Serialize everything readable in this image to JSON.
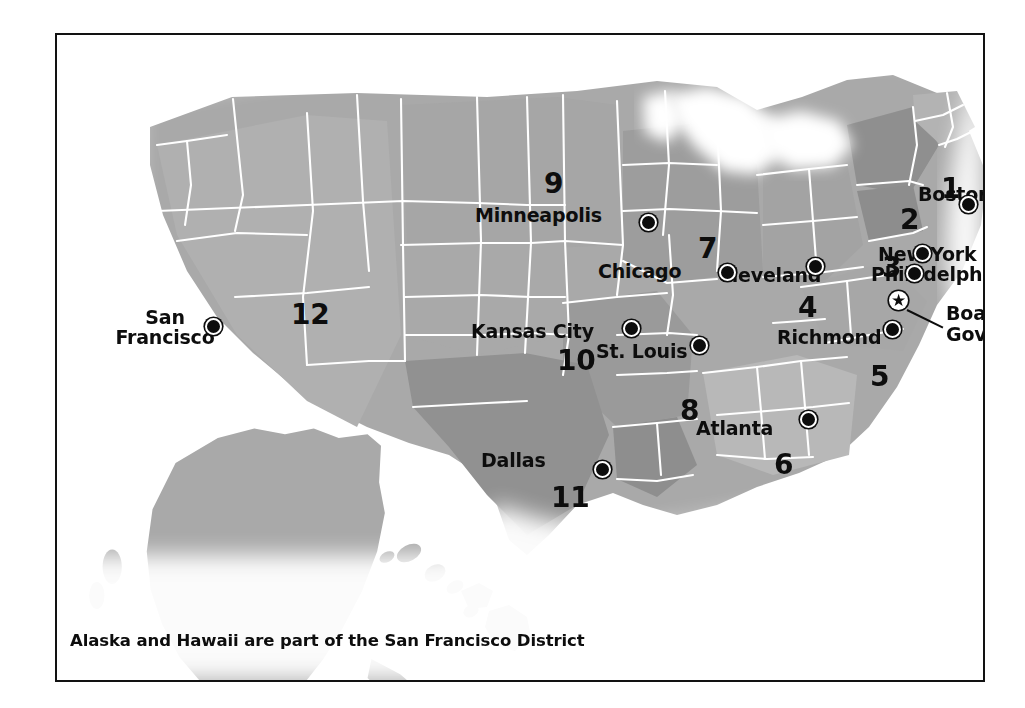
{
  "figure": {
    "footnote": "Alaska and Hawaii are part of the San Francisco District",
    "frame_color": "#121212",
    "background_color": "#ffffff",
    "land_color": "#a9a9a9",
    "border_color": "#ffffff",
    "marker_color": "#0d0d0d"
  },
  "districts": [
    {
      "number": "1",
      "bank": "Boston",
      "x": 891,
      "y": 153
    },
    {
      "number": "2",
      "bank": "New York",
      "x": 850,
      "y": 184
    },
    {
      "number": "3",
      "bank": "Philadelphia",
      "x": 832,
      "y": 232
    },
    {
      "number": "4",
      "bank": "Cleveland",
      "x": 748,
      "y": 272
    },
    {
      "number": "5",
      "bank": "Richmond",
      "x": 820,
      "y": 341
    },
    {
      "number": "6",
      "bank": "Atlanta",
      "x": 724,
      "y": 429
    },
    {
      "number": "7",
      "bank": "Chicago",
      "x": 648,
      "y": 213
    },
    {
      "number": "8",
      "bank": "St. Louis",
      "x": 630,
      "y": 375
    },
    {
      "number": "9",
      "bank": "Minneapolis",
      "x": 494,
      "y": 148
    },
    {
      "number": "10",
      "bank": "Kansas City",
      "x": 514,
      "y": 325
    },
    {
      "number": "11",
      "bank": "Dallas",
      "x": 508,
      "y": 462
    },
    {
      "number": "12",
      "bank": "San Francisco",
      "x": 248,
      "y": 279
    }
  ],
  "cities": [
    {
      "name": "Boston",
      "label_x": 916,
      "label_y": 159,
      "dot_x": 911,
      "dot_y": 169,
      "align": "left"
    },
    {
      "name": "New York",
      "label_x": 876,
      "label_y": 219,
      "dot_x": 865,
      "dot_y": 218,
      "align": "left"
    },
    {
      "name": "Philadelphia",
      "label_x": 869,
      "label_y": 239,
      "dot_x": 857,
      "dot_y": 238,
      "align": "left"
    },
    {
      "name": "Cleveland",
      "label_x": 716,
      "label_y": 240,
      "dot_x": 758,
      "dot_y": 231,
      "align": "left"
    },
    {
      "name": "Richmond",
      "label_x": 775,
      "label_y": 302,
      "dot_x": 835,
      "dot_y": 294,
      "align": "left"
    },
    {
      "name": "Atlanta",
      "label_x": 694,
      "label_y": 393,
      "dot_x": 751,
      "dot_y": 384,
      "align": "left"
    },
    {
      "name": "Chicago",
      "label_x": 596,
      "label_y": 236,
      "dot_x": 670,
      "dot_y": 237,
      "align": "left"
    },
    {
      "name": "St. Louis",
      "label_x": 594,
      "label_y": 316,
      "dot_x": 642,
      "dot_y": 310,
      "align": "left"
    },
    {
      "name": "Minneapolis",
      "label_x": 473,
      "label_y": 180,
      "dot_x": 591,
      "dot_y": 187,
      "align": "left"
    },
    {
      "name": "Kansas City",
      "label_x": 469,
      "label_y": 296,
      "dot_x": 574,
      "dot_y": 293,
      "align": "left"
    },
    {
      "name": "Dallas",
      "label_x": 479,
      "label_y": 425,
      "dot_x": 545,
      "dot_y": 434,
      "align": "left"
    },
    {
      "name": "Dallas-hidden",
      "label_x": 0,
      "label_y": 0,
      "dot_x": 0,
      "dot_y": 0,
      "align": "left"
    }
  ],
  "san_francisco": {
    "line1": "San",
    "line2": "Francisco",
    "label_x": 72,
    "label_y": 296,
    "dot_x": 156,
    "dot_y": 291
  },
  "board_of_governors": {
    "line1": "Board of",
    "line2": "Governors",
    "label_x": 889,
    "label_y": 280,
    "star_x": 841,
    "star_y": 265,
    "star_glyph": "★",
    "leader_x": 850,
    "leader_y": 274,
    "leader_length": 40,
    "leader_angle": 26
  },
  "footnote": {
    "text": "Alaska and Hawaii are part of the San Francisco District",
    "x": 68,
    "y": 638
  }
}
